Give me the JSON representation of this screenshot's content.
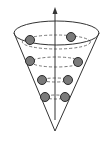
{
  "diagram": {
    "type": "cone-with-orbiting-particles",
    "colors": {
      "background": "#ffffff",
      "outline": "#333333",
      "orbit": "#555555",
      "ball_fill": "#7a7a7a",
      "ball_stroke": "#2a2a2a"
    },
    "axis": {
      "x": 55,
      "y_top": 7,
      "y_bottom": 120,
      "arrow": "up"
    },
    "cone": {
      "rim": {
        "cx": 56.5,
        "cy": 33,
        "rx": 42.5,
        "ry": 12
      },
      "apex": {
        "x": 55,
        "y": 131
      }
    },
    "orbits": [
      {
        "cy": 42,
        "rx": 34,
        "ry": 7
      },
      {
        "cy": 62,
        "rx": 25,
        "ry": 5
      },
      {
        "cy": 80,
        "rx": 14,
        "ry": 2
      },
      {
        "cy": 97,
        "rx": 11,
        "ry": 2
      }
    ],
    "balls": [
      {
        "cx": 30,
        "cy": 40,
        "r": 4.5
      },
      {
        "cx": 71,
        "cy": 37,
        "r": 4.5
      },
      {
        "cx": 30,
        "cy": 61,
        "r": 4.5
      },
      {
        "cx": 78,
        "cy": 62,
        "r": 4.5
      },
      {
        "cx": 42,
        "cy": 80,
        "r": 4.5
      },
      {
        "cx": 68,
        "cy": 80,
        "r": 4.5
      },
      {
        "cx": 45,
        "cy": 97,
        "r": 4.5
      },
      {
        "cx": 65,
        "cy": 97,
        "r": 4.5
      }
    ]
  }
}
